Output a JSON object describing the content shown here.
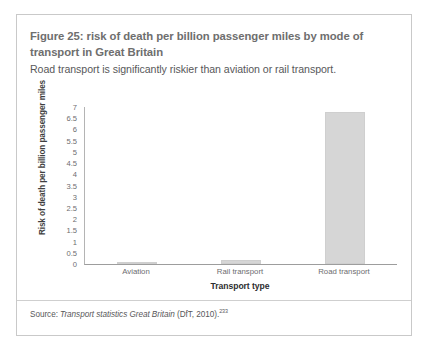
{
  "figure": {
    "title": "Figure 25: risk of death per billion passenger miles by mode of transport in Great Britain",
    "subtitle": "Road transport is significantly riskier than aviation or rail transport.",
    "source_prefix": "Source: ",
    "source_title": "Transport statistics Great Britain",
    "source_suffix": " (DfT, 2010).",
    "source_reference": "233"
  },
  "colors": {
    "bar_fill": "#d6d6d6",
    "bar_stroke": "#cfcfcf",
    "card_border": "#c9c9c9",
    "title_text": "#6e6e6e",
    "body_text": "#58585a",
    "axis_line": "#9d9d9d"
  },
  "chart_data": {
    "type": "bar",
    "title": "Figure 25: risk of death per billion passenger miles by mode of transport in Great Britain",
    "subtitle": "Road transport is significantly riskier than aviation or rail transport.",
    "categories": [
      "Aviation",
      "Rail transport",
      "Road transport"
    ],
    "values": [
      0.03,
      0.2,
      6.8
    ],
    "xlabel": "Transport type",
    "ylabel": "Risk of death per billion passenger miles",
    "ylim": [
      0,
      7
    ],
    "ytick_step": 0.5,
    "yticks": [
      7,
      6.5,
      6,
      5.5,
      5,
      4.5,
      4,
      3.5,
      3,
      2.5,
      2,
      1.5,
      1,
      0.5,
      0
    ],
    "ytick_labels": [
      "7",
      "6.5",
      "6",
      "5.5",
      "5",
      "4.5",
      "4",
      "3.5",
      "3",
      "2.5",
      "2",
      "1.5",
      "1",
      "0.5",
      "0"
    ],
    "grid": false,
    "legend": false
  }
}
